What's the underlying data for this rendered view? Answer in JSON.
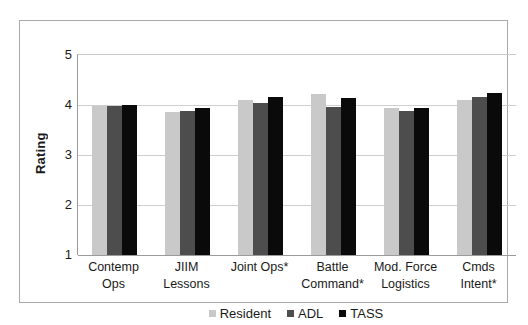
{
  "chart_data": {
    "type": "bar",
    "title": "",
    "xlabel": "",
    "ylabel": "Rating",
    "ylim": [
      1,
      5
    ],
    "yticks": [
      "5",
      "4",
      "3",
      "2",
      "1"
    ],
    "ytick_values": [
      5,
      4,
      3,
      2,
      1
    ],
    "grid": true,
    "legend_position": "bottom",
    "categories": [
      "Contemp Ops",
      "JIIM Lessons",
      "Joint Ops*",
      "Battle Command*",
      "Mod. Force Logistics",
      "Cmds Intent*"
    ],
    "category_lines": [
      [
        "Contemp",
        "Ops"
      ],
      [
        "JIIM",
        "Lessons"
      ],
      [
        "Joint Ops*",
        ""
      ],
      [
        "Battle",
        "Command*"
      ],
      [
        "Mod. Force",
        "Logistics"
      ],
      [
        "Cmds",
        "Intent*"
      ]
    ],
    "series": [
      {
        "name": "Resident",
        "color": "#c9c9c9",
        "values": [
          3.98,
          3.87,
          4.1,
          4.23,
          3.94,
          4.1
        ]
      },
      {
        "name": "ADL",
        "color": "#4d4d4d",
        "values": [
          3.98,
          3.88,
          4.05,
          3.97,
          3.89,
          4.16
        ]
      },
      {
        "name": "TASS",
        "color": "#0a0a0a",
        "values": [
          4.0,
          3.94,
          4.17,
          4.14,
          3.95,
          4.25
        ]
      }
    ]
  },
  "legend": {
    "items": [
      {
        "label": "Resident",
        "color": "#c9c9c9"
      },
      {
        "label": "ADL",
        "color": "#4d4d4d"
      },
      {
        "label": "TASS",
        "color": "#0a0a0a"
      }
    ]
  },
  "axes": {
    "y_title": "Rating"
  }
}
